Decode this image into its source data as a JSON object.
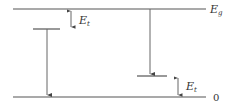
{
  "diagram": {
    "levels": {
      "top": {
        "label": "E",
        "subscript": "g"
      },
      "bottom": {
        "label": "0"
      }
    },
    "annotations": [
      {
        "label": "E",
        "subscript": "t",
        "position": "below conduction band, left"
      },
      {
        "label": "E",
        "subscript": "t",
        "position": "above valence band, right"
      }
    ],
    "colors": {
      "line": "#444444",
      "text": "#333333"
    }
  }
}
